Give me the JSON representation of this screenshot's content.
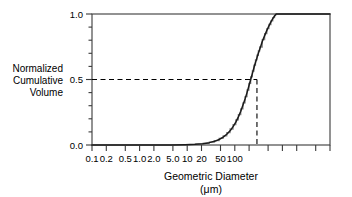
{
  "chart_data": {
    "type": "line",
    "title": "",
    "xlabel": "Geometric Diameter",
    "xunits": "(μm)",
    "ylabel_lines": [
      "Normalized",
      "Cumulative",
      "Volume"
    ],
    "ylabel": "Normalized Cumulative Volume",
    "xscale": "log",
    "xlim": [
      0.1,
      100
    ],
    "ylim": [
      0.0,
      1.0
    ],
    "grid": false,
    "legend": null,
    "xtick_labels": [
      "0.1",
      "0.2",
      "0.5",
      "1.0",
      "2.0",
      "5.0",
      "10",
      "20",
      "50",
      "100"
    ],
    "xtick_values": [
      0.1,
      0.2,
      0.5,
      1.0,
      2.0,
      5.0,
      10,
      20,
      50,
      100
    ],
    "ytick_labels": [
      "0.0",
      "0.5",
      "1.0"
    ],
    "ytick_values": [
      0.0,
      0.5,
      1.0
    ],
    "yminor_ticks": [
      0.1,
      0.2,
      0.3,
      0.4,
      0.6,
      0.7,
      0.8,
      0.9
    ],
    "series": [
      {
        "name": "smooth cumulative curve",
        "style": "solid-black",
        "color": "#1a1a1a",
        "x": [
          0.1,
          0.5,
          1.0,
          1.5,
          2.0,
          2.5,
          3.0,
          3.5,
          4.0,
          4.5,
          5.0,
          5.5,
          6.0,
          6.5,
          7.0,
          7.5,
          8.0,
          8.5,
          9.0,
          9.5,
          10.0,
          10.5,
          11.0,
          11.5,
          12.0,
          12.5,
          13.0,
          13.5,
          14.0,
          15.0,
          16.0,
          17.0,
          18.0,
          19.0,
          20.0,
          21.0,
          100.0
        ],
        "y": [
          0.0,
          0.0,
          0.0,
          0.002,
          0.005,
          0.01,
          0.018,
          0.028,
          0.042,
          0.06,
          0.082,
          0.108,
          0.14,
          0.175,
          0.215,
          0.258,
          0.305,
          0.352,
          0.4,
          0.45,
          0.5,
          0.545,
          0.59,
          0.63,
          0.665,
          0.7,
          0.73,
          0.76,
          0.79,
          0.835,
          0.875,
          0.91,
          0.94,
          0.965,
          0.985,
          1.0,
          1.0
        ]
      },
      {
        "name": "stepped cumulative histogram",
        "style": "step-gray",
        "color": "#8c8c8c",
        "x": [
          0.1,
          1.0,
          1.5,
          2.0,
          2.5,
          3.0,
          3.5,
          4.0,
          4.5,
          5.0,
          5.5,
          6.0,
          6.5,
          7.0,
          7.5,
          8.0,
          8.5,
          9.0,
          9.5,
          10.0,
          10.5,
          11.0,
          11.5,
          12.0,
          12.5,
          13.0,
          14.0,
          15.0,
          16.0,
          17.0,
          18.0,
          19.0,
          20.0,
          21.0,
          100.0
        ],
        "y": [
          0.0,
          0.0,
          0.003,
          0.007,
          0.013,
          0.022,
          0.034,
          0.05,
          0.07,
          0.094,
          0.122,
          0.155,
          0.192,
          0.232,
          0.275,
          0.322,
          0.37,
          0.42,
          0.47,
          0.52,
          0.565,
          0.61,
          0.65,
          0.685,
          0.718,
          0.748,
          0.805,
          0.85,
          0.888,
          0.92,
          0.948,
          0.972,
          0.995,
          1.0,
          1.0
        ]
      }
    ],
    "annotations": [
      {
        "name": "median-reference-lines",
        "style": "dashed",
        "color": "#000000",
        "y_value": 0.5,
        "x_value": 12.0,
        "description": "dashed horizontal line at cumulative volume 0.5 meeting dashed vertical line at the median geometric diameter"
      }
    ]
  }
}
